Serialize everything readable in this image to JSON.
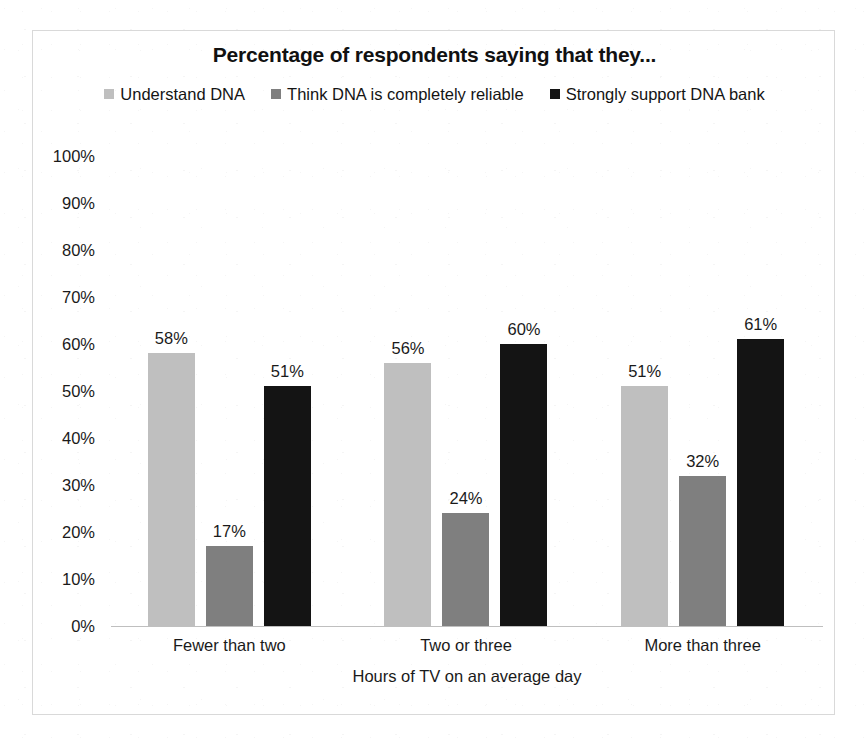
{
  "chart_data": {
    "type": "bar",
    "title": "Percentage of respondents saying that they...",
    "xlabel": "Hours of TV on an average day",
    "ylabel": "",
    "categories": [
      "Fewer than two",
      "Two or three",
      "More than three"
    ],
    "series": [
      {
        "name": "Understand DNA",
        "color": "#bfbfbf",
        "values": [
          58,
          56,
          51
        ],
        "labels": [
          "58%",
          "56%",
          "51%"
        ]
      },
      {
        "name": "Think DNA is completely reliable",
        "color": "#7f7f7f",
        "values": [
          17,
          24,
          32
        ],
        "labels": [
          "17%",
          "24%",
          "32%"
        ]
      },
      {
        "name": "Strongly support DNA bank",
        "color": "#141414",
        "values": [
          51,
          60,
          61
        ],
        "labels": [
          "51%",
          "60%",
          "61%"
        ]
      }
    ],
    "ylim": [
      0,
      100
    ],
    "y_tick_step": 10,
    "y_ticks": [
      "0%",
      "10%",
      "20%",
      "30%",
      "40%",
      "50%",
      "60%",
      "70%",
      "80%",
      "90%",
      "100%"
    ],
    "grid": false,
    "legend_position": "top",
    "value_suffix": "%"
  },
  "legend": {
    "swatch_icon": "square-swatch-icon"
  },
  "frame": {
    "border_color": "#d9d9d9",
    "axis_color": "#bfbfbf"
  }
}
